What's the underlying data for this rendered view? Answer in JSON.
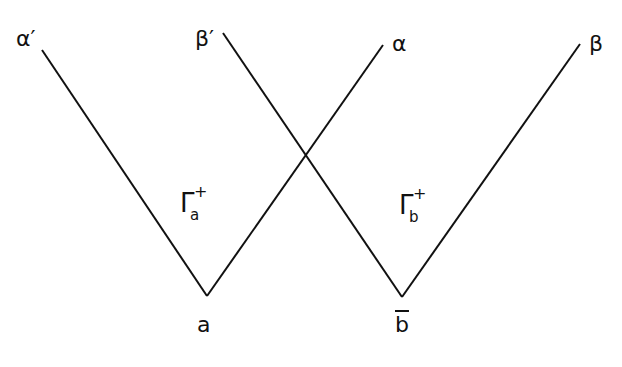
{
  "diagram": {
    "type": "light-cone-lines",
    "line_color": "#111111",
    "endpoints": {
      "alpha_prime": "α′",
      "beta_prime": "β′",
      "alpha": "α",
      "beta": "β"
    },
    "vertices": {
      "a": "a",
      "b_bar": "b"
    },
    "regions": {
      "gamma_a": {
        "symbol": "Γ",
        "sub": "a",
        "sup": "+"
      },
      "gamma_b": {
        "symbol": "Γ",
        "sub": "b",
        "sup": "+"
      }
    }
  }
}
